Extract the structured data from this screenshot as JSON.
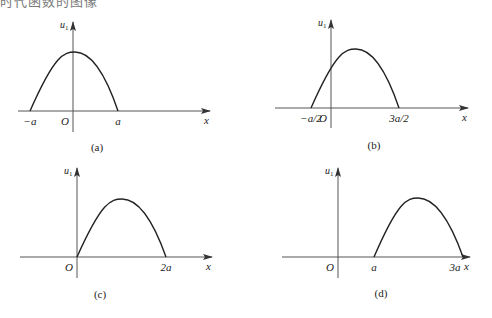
{
  "header_fragment": "时代函数的图像",
  "colors": {
    "axis": "#555555",
    "curve": "#222222",
    "text": "#222222"
  },
  "panels": [
    {
      "id": "a",
      "caption": "(a)",
      "y_label": "u",
      "y_label_sub": "1",
      "x_label": "x",
      "origin_label": "O",
      "ticks": [
        {
          "label": "−a",
          "x": 30
        },
        {
          "label": "a",
          "x": 118
        }
      ],
      "axis": {
        "x0": 18,
        "x1": 210,
        "y": 111,
        "ox": 73,
        "ytop": 22,
        "ybottom": 132
      },
      "curve": {
        "start": [
          30,
          111
        ],
        "peak": [
          75,
          52
        ],
        "end": [
          118,
          111
        ]
      },
      "caption_pos": [
        97,
        151
      ]
    },
    {
      "id": "b",
      "caption": "(b)",
      "y_label": "u",
      "y_label_sub": "1",
      "x_label": "x",
      "origin_label": "O",
      "ticks": [
        {
          "label": "−a/2",
          "x": 311
        },
        {
          "label": "3a/2",
          "x": 399
        }
      ],
      "axis": {
        "x0": 275,
        "x1": 468,
        "y": 108,
        "ox": 331,
        "ytop": 20,
        "ybottom": 128
      },
      "curve": {
        "start": [
          311,
          108
        ],
        "peak": [
          356,
          49
        ],
        "end": [
          399,
          108
        ]
      },
      "caption_pos": [
        374,
        149
      ]
    },
    {
      "id": "c",
      "caption": "(c)",
      "y_label": "u",
      "y_label_sub": "1",
      "x_label": "x",
      "origin_label": "O",
      "ticks": [
        {
          "label": "2a",
          "x": 166
        }
      ],
      "axis": {
        "x0": 20,
        "x1": 212,
        "y": 257,
        "ox": 77,
        "ytop": 168,
        "ybottom": 278
      },
      "curve": {
        "start": [
          77,
          257
        ],
        "peak": [
          122,
          199
        ],
        "end": [
          166,
          257
        ]
      },
      "caption_pos": [
        100,
        298
      ]
    },
    {
      "id": "d",
      "caption": "(d)",
      "y_label": "u",
      "y_label_sub": "1",
      "x_label": "x",
      "origin_label": "O",
      "ticks": [
        {
          "label": "a",
          "x": 374
        },
        {
          "label": "3a",
          "x": 455
        }
      ],
      "axis": {
        "x0": 282,
        "x1": 470,
        "y": 257,
        "ox": 338,
        "ytop": 168,
        "ybottom": 278
      },
      "curve": {
        "start": [
          374,
          257
        ],
        "peak": [
          418,
          198
        ],
        "end": [
          463,
          257
        ]
      },
      "caption_pos": [
        381,
        297
      ]
    }
  ]
}
